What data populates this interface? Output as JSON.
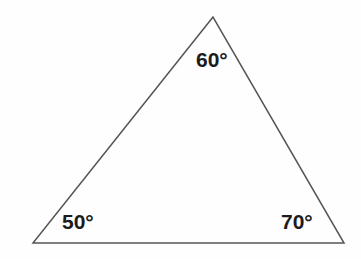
{
  "figure": {
    "type": "geometry-diagram",
    "shape": "triangle",
    "background_color": "#fefefe",
    "stroke_color": "#555555",
    "stroke_width": 1.5,
    "text_color": "#1c1c1c"
  },
  "triangle": {
    "vertices": {
      "apex": {
        "x": 213,
        "y": 17
      },
      "bottom_left": {
        "x": 33,
        "y": 243
      },
      "bottom_right": {
        "x": 344,
        "y": 243
      }
    },
    "points_attr": "213,17 33,243 344,243"
  },
  "labels": {
    "apex": "60°",
    "bottom_left": "50°",
    "bottom_right": "70°"
  },
  "chart_data": {
    "type": "table",
    "title": "",
    "categories": [
      "apex",
      "bottom-left",
      "bottom-right"
    ],
    "values": [
      60,
      50,
      70
    ],
    "annotations": [
      "60°",
      "50°",
      "70°"
    ]
  }
}
